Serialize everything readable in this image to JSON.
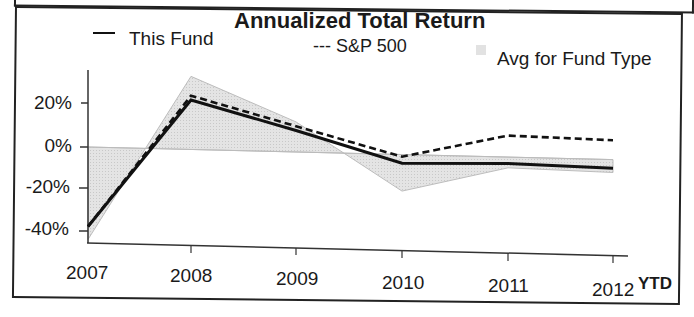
{
  "chart_data": {
    "type": "line",
    "title": "Annualized Total Return",
    "xlabel": "",
    "ylabel": "",
    "categories": [
      "2007",
      "2008",
      "2009",
      "2010",
      "2011",
      "2012"
    ],
    "x_suffix_label": "YTD",
    "series": [
      {
        "name": "This Fund",
        "style": "solid",
        "values": [
          -37,
          23,
          10,
          -4,
          -3,
          -4
        ]
      },
      {
        "name": "S&P 500",
        "style": "dashed",
        "values": [
          -37,
          25,
          12,
          -1,
          10,
          9
        ]
      },
      {
        "name": "Avg for Fund Type",
        "style": "shaded-area",
        "values": [
          -43,
          34,
          14,
          -17,
          -5,
          -6
        ]
      }
    ],
    "yticks": [
      "20%",
      "0%",
      "-20%",
      "-40%"
    ],
    "ylim": [
      -45,
      40
    ],
    "grid": false,
    "legend_position": "top"
  },
  "legend": {
    "this_fund": "This Fund",
    "sp500": "--- S&P 500",
    "avg": "Avg for Fund Type"
  },
  "colors": {
    "line": "#111111",
    "area": "#dcdcdc"
  }
}
